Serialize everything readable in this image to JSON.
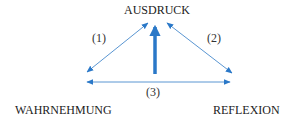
{
  "diagram": {
    "nodes": {
      "top": "AUSDRUCK",
      "left": "WAHRNEHMUNG",
      "right": "REFLEXION"
    },
    "edges": [
      {
        "label": "(1)",
        "from": "WAHRNEHMUNG",
        "to": "AUSDRUCK",
        "style": "thin double-headed"
      },
      {
        "label": "(2)",
        "from": "AUSDRUCK",
        "to": "REFLEXION",
        "style": "thin double-headed"
      },
      {
        "label": "(3)",
        "from": "WAHRNEHMUNG",
        "to": "REFLEXION",
        "style": "thin double-headed"
      },
      {
        "label": "",
        "from": "center",
        "to": "AUSDRUCK",
        "style": "thick single-headed"
      }
    ],
    "colors": {
      "arrow": "#2a78c8",
      "text": "#222222"
    }
  }
}
